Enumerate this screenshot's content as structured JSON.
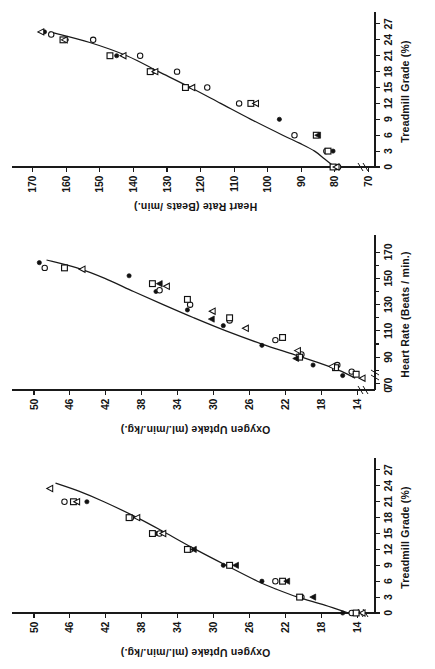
{
  "figure": {
    "orientation_degrees": -90,
    "background_color": "#ffffff",
    "ink_color": "#111111",
    "panel_count": 3
  },
  "chart_data": [
    {
      "panel_index": 1,
      "panel_position": "left",
      "type": "scatter",
      "title": "",
      "xlabel": "Treadmill Grade (%)",
      "ylabel": "Oxygen Uptake (ml./min./kg.)",
      "xlim": [
        0,
        28.5
      ],
      "ylim": [
        12,
        52
      ],
      "xticks": [
        0,
        3,
        6,
        9,
        12,
        15,
        18,
        21,
        24,
        27
      ],
      "xtick_labels": [
        "0",
        "3",
        "6",
        "9",
        "12",
        "15",
        "18",
        "21",
        "24",
        "27"
      ],
      "yticks": [
        14,
        18,
        22,
        26,
        30,
        34,
        38,
        42,
        46,
        50
      ],
      "ytick_labels": [
        "14",
        "18",
        "22",
        "26",
        "30",
        "34",
        "38",
        "42",
        "46",
        "50"
      ],
      "grid": false,
      "legend_position": "none",
      "axis_break_on_y": true,
      "fit_curve_label": "regression curve",
      "fit_curve_points": [
        [
          0,
          15.0
        ],
        [
          1.5,
          17.6
        ],
        [
          3,
          20.6
        ],
        [
          4.5,
          23.0
        ],
        [
          6,
          25.1
        ],
        [
          9,
          28.6
        ],
        [
          12,
          32.0
        ],
        [
          15,
          35.2
        ],
        [
          18,
          38.5
        ],
        [
          21,
          42.2
        ],
        [
          23,
          45.0
        ],
        [
          24.5,
          47.6
        ]
      ],
      "series": [
        {
          "name": "filled-circle",
          "marker": "filled-circle",
          "points": [
            [
              0,
              15.6
            ],
            [
              3,
              20.2
            ],
            [
              6,
              24.6
            ],
            [
              9,
              28.9
            ],
            [
              12,
              32.9
            ],
            [
              15,
              36.4
            ],
            [
              18,
              39.4
            ],
            [
              21,
              44.1
            ]
          ]
        },
        {
          "name": "open-circle",
          "marker": "open-circle",
          "points": [
            [
              0,
              14.6
            ],
            [
              3,
              20.2
            ],
            [
              6,
              23.1
            ],
            [
              9,
              28.2
            ],
            [
              12,
              32.6
            ],
            [
              15,
              36.0
            ],
            [
              18,
              39.2
            ],
            [
              21,
              46.6
            ]
          ]
        },
        {
          "name": "open-square",
          "marker": "open-square",
          "points": [
            [
              0,
              14.1
            ],
            [
              3,
              20.4
            ],
            [
              6,
              22.3
            ],
            [
              9,
              28.2
            ],
            [
              12,
              32.9
            ],
            [
              15,
              36.8
            ],
            [
              18,
              39.4
            ],
            [
              21,
              45.6
            ]
          ]
        },
        {
          "name": "open-triangle",
          "marker": "open-triangle",
          "points": [
            [
              0,
              13.4
            ],
            [
              15,
              35.6
            ],
            [
              18,
              38.5
            ],
            [
              21,
              45.2
            ],
            [
              23.5,
              48.2
            ]
          ]
        },
        {
          "name": "filled-triangle",
          "marker": "filled-triangle",
          "points": [
            [
              3,
              18.9
            ],
            [
              6,
              21.8
            ],
            [
              9,
              27.5
            ],
            [
              12,
              32.2
            ]
          ]
        }
      ]
    },
    {
      "panel_index": 2,
      "panel_position": "middle",
      "type": "scatter",
      "title": "",
      "xlabel": "Heart Rate (Beats / min.)",
      "ylabel": "Oxygen Uptake (ml./min./kg.)",
      "xlim": [
        65,
        180
      ],
      "ylim": [
        12,
        52
      ],
      "xticks": [
        70,
        90,
        110,
        130,
        150,
        170
      ],
      "xtick_labels": [
        "70",
        "90",
        "110",
        "130",
        "150",
        "170"
      ],
      "xminor_ticks": [
        80,
        100,
        120,
        140,
        160
      ],
      "yticks": [
        14,
        18,
        22,
        26,
        30,
        34,
        38,
        42,
        46,
        50
      ],
      "ytick_labels": [
        "14",
        "18",
        "22",
        "26",
        "30",
        "34",
        "38",
        "42",
        "46",
        "50"
      ],
      "grid": false,
      "legend_position": "none",
      "axis_break_on_x": true,
      "axis_break_on_y": true,
      "origin_label": "0",
      "fit_curve_label": "regression curve",
      "fit_curve_points": [
        [
          74,
          14.2
        ],
        [
          80,
          16.0
        ],
        [
          86,
          18.4
        ],
        [
          92,
          21.0
        ],
        [
          100,
          24.6
        ],
        [
          110,
          28.6
        ],
        [
          120,
          32.2
        ],
        [
          130,
          35.6
        ],
        [
          140,
          38.9
        ],
        [
          150,
          42.1
        ],
        [
          158,
          45.2
        ],
        [
          164,
          48.6
        ]
      ],
      "series": [
        {
          "name": "filled-circle",
          "marker": "filled-circle",
          "points": [
            [
              76,
              15.6
            ],
            [
              84,
              18.9
            ],
            [
              99,
              24.6
            ],
            [
              114,
              28.9
            ],
            [
              126,
              32.9
            ],
            [
              140,
              36.4
            ],
            [
              152,
              39.4
            ],
            [
              162,
              49.4
            ]
          ]
        },
        {
          "name": "open-circle",
          "marker": "open-circle",
          "points": [
            [
              79,
              14.6
            ],
            [
              84,
              16.2
            ],
            [
              92,
              20.2
            ],
            [
              103,
              23.1
            ],
            [
              118,
              28.2
            ],
            [
              130,
              32.6
            ],
            [
              141,
              36.0
            ],
            [
              158,
              48.8
            ]
          ]
        },
        {
          "name": "open-square",
          "marker": "open-square",
          "points": [
            [
              77,
              14.1
            ],
            [
              82,
              16.4
            ],
            [
              90,
              20.4
            ],
            [
              105,
              22.3
            ],
            [
              120,
              28.2
            ],
            [
              134,
              32.9
            ],
            [
              146,
              36.8
            ],
            [
              158,
              46.6
            ]
          ]
        },
        {
          "name": "open-triangle",
          "marker": "open-triangle",
          "points": [
            [
              74,
              13.4
            ],
            [
              83,
              16.8
            ],
            [
              95,
              20.6
            ],
            [
              112,
              26.4
            ],
            [
              125,
              30.1
            ],
            [
              144,
              35.2
            ],
            [
              157,
              44.6
            ]
          ]
        },
        {
          "name": "filled-triangle",
          "marker": "filled-triangle",
          "points": [
            [
              89,
              20.8
            ],
            [
              119,
              30.2
            ],
            [
              146,
              36.0
            ]
          ]
        }
      ]
    },
    {
      "panel_index": 3,
      "panel_position": "right",
      "type": "scatter",
      "title": "",
      "xlabel": "Treadmill Grade (%)",
      "ylabel": "Heart Rate (Beats /min.)",
      "xlim": [
        0,
        28.5
      ],
      "ylim": [
        68,
        175
      ],
      "xticks": [
        0,
        3,
        6,
        9,
        12,
        15,
        18,
        21,
        24,
        27
      ],
      "xtick_labels": [
        "0",
        "3",
        "6",
        "9",
        "12",
        "15",
        "18",
        "21",
        "24",
        "27"
      ],
      "yticks": [
        70,
        80,
        90,
        100,
        110,
        120,
        130,
        140,
        150,
        160,
        170
      ],
      "ytick_labels": [
        "70",
        "80",
        "90",
        "100",
        "110",
        "120",
        "130",
        "140",
        "150",
        "160",
        "170"
      ],
      "grid": false,
      "legend_position": "none",
      "axis_break_on_y": true,
      "fit_curve_label": "regression curve",
      "fit_curve_points": [
        [
          0,
          80.0
        ],
        [
          1.5,
          83.0
        ],
        [
          3,
          86.0
        ],
        [
          4.5,
          90.5
        ],
        [
          6,
          95.5
        ],
        [
          9,
          105.0
        ],
        [
          12,
          114.0
        ],
        [
          15,
          123.0
        ],
        [
          18,
          132.5
        ],
        [
          21,
          142.0
        ],
        [
          23.5,
          153.0
        ],
        [
          25.5,
          165.0
        ]
      ],
      "series": [
        {
          "name": "filled-circle",
          "marker": "filled-circle",
          "points": [
            [
              3,
              80.5
            ],
            [
              9,
              96.5
            ],
            [
              12,
              105.0
            ],
            [
              15,
              124.0
            ],
            [
              18,
              134.0
            ],
            [
              21,
              145.0
            ],
            [
              24,
              160.0
            ],
            [
              25.5,
              166.5
            ]
          ]
        },
        {
          "name": "open-circle",
          "marker": "open-circle",
          "points": [
            [
              0,
              79.0
            ],
            [
              3,
              82.5
            ],
            [
              6,
              92.0
            ],
            [
              12,
              108.5
            ],
            [
              15,
              118.0
            ],
            [
              18,
              127.0
            ],
            [
              21,
              138.0
            ],
            [
              24,
              152.0
            ],
            [
              25,
              164.5
            ]
          ]
        },
        {
          "name": "open-square",
          "marker": "open-square",
          "points": [
            [
              0,
              80.5
            ],
            [
              3,
              82.0
            ],
            [
              6,
              85.5
            ],
            [
              12,
              105.0
            ],
            [
              15,
              124.5
            ],
            [
              18,
              135.0
            ],
            [
              21,
              147.0
            ],
            [
              24,
              161.0
            ]
          ]
        },
        {
          "name": "open-triangle",
          "marker": "open-triangle",
          "points": [
            [
              0,
              79.5
            ],
            [
              12,
              103.5
            ],
            [
              15,
              122.5
            ],
            [
              18,
              133.5
            ],
            [
              21,
              143.0
            ],
            [
              24,
              160.5
            ],
            [
              25.5,
              167.5
            ]
          ]
        },
        {
          "name": "filled-triangle",
          "marker": "filled-triangle",
          "points": [
            [
              6,
              85.0
            ]
          ]
        }
      ]
    }
  ]
}
